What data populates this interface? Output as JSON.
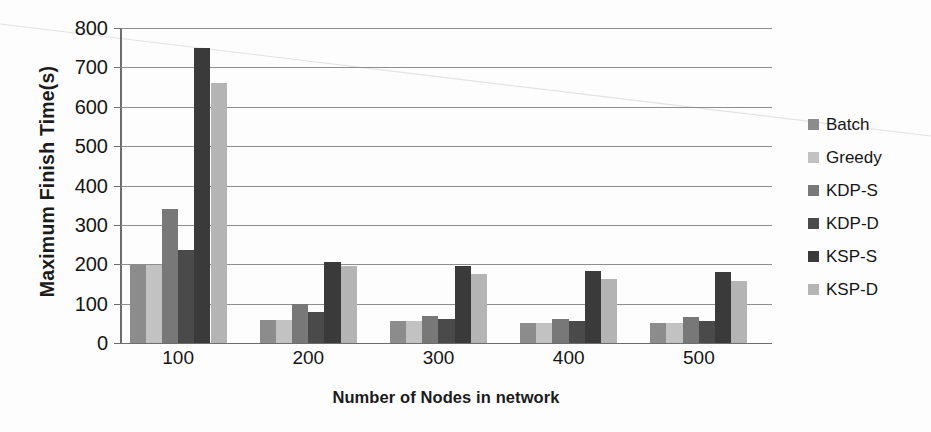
{
  "chart_data": {
    "type": "bar",
    "title": "",
    "subtitle": "",
    "xlabel": "Number of Nodes in network",
    "ylabel": "Maximum Finish Time(s)",
    "categories": [
      "100",
      "200",
      "300",
      "400",
      "500"
    ],
    "ylim": [
      0,
      800
    ],
    "yticks": [
      0,
      100,
      200,
      300,
      400,
      500,
      600,
      700,
      800
    ],
    "ytick_labels": [
      "0",
      "100",
      "200",
      "300",
      "400",
      "500",
      "600",
      "700",
      "800"
    ],
    "grid": true,
    "grid_axis": "y",
    "legend_position": "right",
    "orientation": "vertical",
    "series": [
      {
        "name": "Batch",
        "color": "#8c8c8c",
        "values": [
          198,
          58,
          55,
          52,
          50
        ]
      },
      {
        "name": "Greedy",
        "color": "#c2c2c2",
        "values": [
          198,
          58,
          55,
          52,
          50
        ]
      },
      {
        "name": "KDP-S",
        "color": "#787878",
        "values": [
          340,
          100,
          68,
          62,
          65
        ]
      },
      {
        "name": "KDP-D",
        "color": "#4a4a4a",
        "values": [
          235,
          78,
          60,
          57,
          55
        ]
      },
      {
        "name": "KSP-S",
        "color": "#3a3a3a",
        "values": [
          750,
          205,
          195,
          182,
          180
        ]
      },
      {
        "name": "KSP-D",
        "color": "#b4b4b4",
        "values": [
          660,
          195,
          175,
          163,
          158
        ]
      }
    ]
  },
  "legend": {
    "items": [
      {
        "label": "Batch",
        "swatch": "#8c8c8c"
      },
      {
        "label": "Greedy",
        "swatch": "#c2c2c2"
      },
      {
        "label": "KDP-S",
        "swatch": "#787878"
      },
      {
        "label": "KDP-D",
        "swatch": "#4a4a4a"
      },
      {
        "label": "KSP-S",
        "swatch": "#3a3a3a"
      },
      {
        "label": "KSP-D",
        "swatch": "#b4b4b4"
      }
    ]
  },
  "axes": {
    "y_title": "Maximum Finish Time(s)",
    "x_title": "Number of Nodes in network"
  }
}
